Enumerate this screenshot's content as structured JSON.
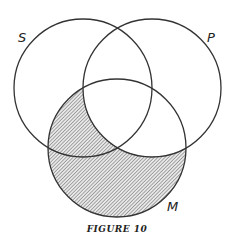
{
  "figure": {
    "caption": "FIGURE 10",
    "circles": [
      {
        "id": "S",
        "label": "S"
      },
      {
        "id": "P",
        "label": "P"
      },
      {
        "id": "M",
        "label": "M"
      }
    ],
    "shaded_region": "M outside P",
    "colors": {
      "stroke": "#333333",
      "hatch": "#555555"
    }
  }
}
